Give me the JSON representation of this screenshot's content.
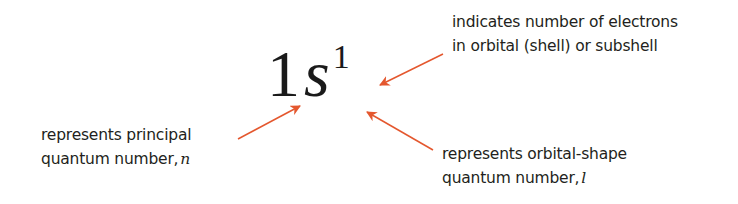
{
  "diagram": {
    "notation": {
      "principal": "1",
      "shape": "s",
      "count": "1"
    },
    "annotations": [
      {
        "id": "electron-count",
        "line1": "indicates number of electrons",
        "line2": "in orbital (shell) or subshell",
        "points_to": "superscript 1"
      },
      {
        "id": "principal",
        "line1": "represents principal",
        "line2_prefix": "quantum number,",
        "variable": "n",
        "points_to": "1"
      },
      {
        "id": "orbital-shape",
        "line1": "represents orbital-shape",
        "line2_prefix": "quantum number,",
        "variable": "l",
        "points_to": "s"
      }
    ],
    "colors": {
      "arrow": "#e4572e",
      "text": "#231f20"
    }
  }
}
